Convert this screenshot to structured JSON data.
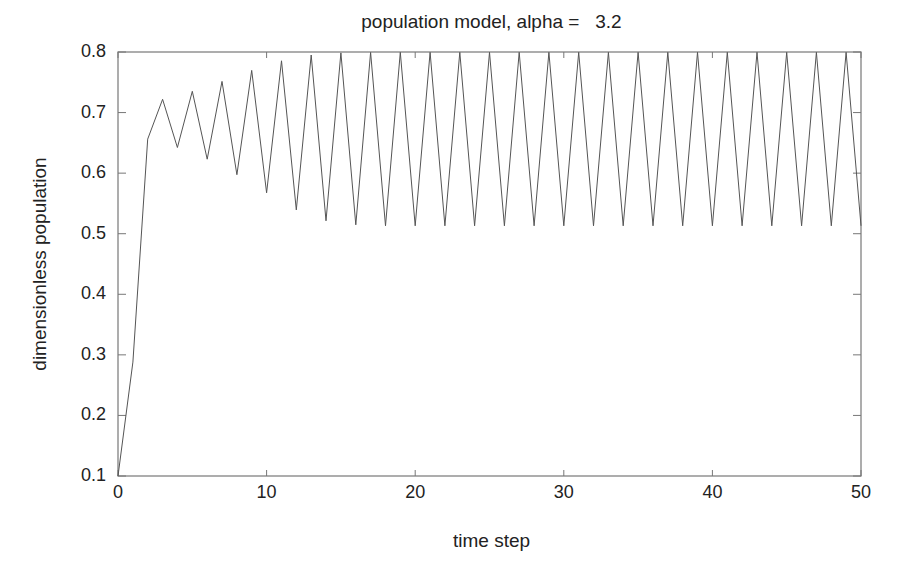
{
  "chart_data": {
    "type": "line",
    "title": "population model, alpha =   3.2",
    "xlabel": "time step",
    "ylabel": "dimensionless population",
    "xlim": [
      0,
      50
    ],
    "ylim": [
      0.1,
      0.8
    ],
    "xticks": [
      0,
      10,
      20,
      30,
      40,
      50
    ],
    "yticks": [
      0.1,
      0.2,
      0.3,
      0.4,
      0.5,
      0.6,
      0.7,
      0.8
    ],
    "xtick_labels": [
      "0",
      "10",
      "20",
      "30",
      "40",
      "50"
    ],
    "ytick_labels": [
      "0.1",
      "0.2",
      "0.3",
      "0.4",
      "0.5",
      "0.6",
      "0.7",
      "0.8"
    ],
    "grid": false,
    "legend": null,
    "line_color": "#555555",
    "series": [
      {
        "name": "population",
        "x": [
          0,
          1,
          2,
          3,
          4,
          5,
          6,
          7,
          8,
          9,
          10,
          11,
          12,
          13,
          14,
          15,
          16,
          17,
          18,
          19,
          20,
          21,
          22,
          23,
          24,
          25,
          26,
          27,
          28,
          29,
          30,
          31,
          32,
          33,
          34,
          35,
          36,
          37,
          38,
          39,
          40,
          41,
          42,
          43,
          44,
          45,
          46,
          47,
          48,
          49,
          50
        ],
        "values": [
          0.1,
          0.288,
          0.6562,
          0.7219,
          0.6424,
          0.7351,
          0.6231,
          0.7515,
          0.5975,
          0.7696,
          0.5675,
          0.7854,
          0.5393,
          0.7951,
          0.5214,
          0.7985,
          0.5147,
          0.7994,
          0.513,
          0.7995,
          0.513,
          0.7995,
          0.513,
          0.7995,
          0.513,
          0.7995,
          0.513,
          0.7995,
          0.513,
          0.7995,
          0.513,
          0.7995,
          0.513,
          0.7995,
          0.513,
          0.7995,
          0.513,
          0.7995,
          0.513,
          0.7995,
          0.513,
          0.7995,
          0.513,
          0.7995,
          0.513,
          0.7995,
          0.513,
          0.7995,
          0.513,
          0.7995,
          0.513
        ]
      }
    ]
  }
}
